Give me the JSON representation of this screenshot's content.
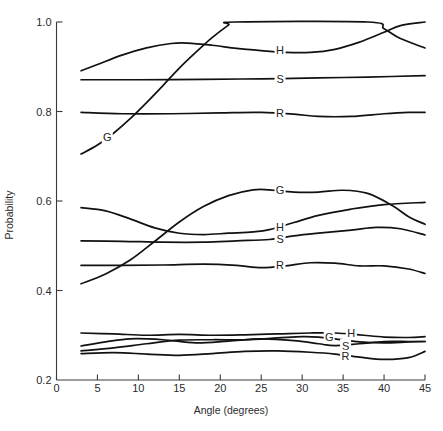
{
  "chart_data": {
    "type": "line",
    "title": "",
    "xlabel": "Angle (degrees)",
    "ylabel": "Probability",
    "xlim": [
      0,
      45
    ],
    "ylim": [
      0.2,
      1.0
    ],
    "xticks": [
      0,
      5,
      10,
      15,
      20,
      25,
      30,
      35,
      40,
      45
    ],
    "xticklabels": [
      "0",
      "5",
      "10",
      "15",
      "20",
      "25",
      "30",
      "35",
      "40",
      "45"
    ],
    "yticks": [
      0.2,
      0.4,
      0.6,
      0.8,
      1.0
    ],
    "yticklabels": [
      "0.2",
      "0.4",
      "0.6",
      "0.8",
      "1.0"
    ],
    "grid": false,
    "legend_position": "inline-labels",
    "groups": [
      {
        "name": "upper-group",
        "series": [
          {
            "name": "G",
            "label": "G",
            "x": [
              3,
              5,
              7,
              9,
              11,
              13,
              15,
              17,
              19,
              21,
              21.8,
              38,
              40,
              42,
              45
            ],
            "values": [
              0.705,
              0.725,
              0.752,
              0.784,
              0.82,
              0.858,
              0.897,
              0.932,
              0.965,
              0.993,
              1.0,
              1.0,
              0.985,
              0.963,
              0.942
            ]
          },
          {
            "name": "H",
            "label": "H",
            "x": [
              3,
              5,
              8,
              11,
              14,
              16,
              19,
              22,
              25,
              28,
              31,
              34,
              37,
              40,
              42,
              45
            ],
            "values": [
              0.891,
              0.905,
              0.926,
              0.942,
              0.952,
              0.953,
              0.948,
              0.941,
              0.936,
              0.932,
              0.932,
              0.939,
              0.955,
              0.977,
              0.992,
              1.0
            ]
          },
          {
            "name": "S",
            "label": "S",
            "x": [
              3,
              10,
              18,
              25,
              32,
              38,
              45
            ],
            "values": [
              0.871,
              0.871,
              0.872,
              0.873,
              0.875,
              0.877,
              0.88
            ]
          },
          {
            "name": "R",
            "label": "R",
            "x": [
              3,
              8,
              14,
              20,
              25,
              29,
              32,
              36,
              40,
              43,
              45
            ],
            "values": [
              0.798,
              0.795,
              0.795,
              0.797,
              0.798,
              0.794,
              0.789,
              0.789,
              0.795,
              0.798,
              0.798
            ]
          }
        ]
      },
      {
        "name": "middle-group",
        "series": [
          {
            "name": "G",
            "label": "G",
            "x": [
              3,
              6,
              9,
              12,
              15,
              18,
              21,
              24,
              26,
              29,
              32,
              35,
              38,
              41,
              43,
              45
            ],
            "values": [
              0.415,
              0.437,
              0.468,
              0.51,
              0.553,
              0.588,
              0.612,
              0.625,
              0.625,
              0.62,
              0.62,
              0.624,
              0.617,
              0.59,
              0.565,
              0.548
            ]
          },
          {
            "name": "H",
            "label": "H",
            "x": [
              3,
              6,
              9,
              12,
              15,
              18,
              21,
              24,
              26,
              29,
              32,
              36,
              40,
              45
            ],
            "values": [
              0.585,
              0.578,
              0.56,
              0.54,
              0.528,
              0.525,
              0.528,
              0.531,
              0.536,
              0.552,
              0.568,
              0.582,
              0.592,
              0.597
            ]
          },
          {
            "name": "S",
            "label": "S",
            "x": [
              3,
              8,
              13,
              18,
              22,
              26,
              29,
              32,
              36,
              39,
              42,
              45
            ],
            "values": [
              0.511,
              0.51,
              0.508,
              0.508,
              0.511,
              0.514,
              0.522,
              0.528,
              0.535,
              0.541,
              0.538,
              0.524
            ]
          },
          {
            "name": "R",
            "label": "R",
            "x": [
              3,
              8,
              13,
              18,
              22,
              25,
              28,
              31,
              34,
              37,
              40,
              43,
              45
            ],
            "values": [
              0.456,
              0.456,
              0.457,
              0.459,
              0.456,
              0.451,
              0.455,
              0.462,
              0.461,
              0.455,
              0.455,
              0.448,
              0.438
            ]
          }
        ]
      },
      {
        "name": "lower-group",
        "series": [
          {
            "name": "H",
            "label": "H",
            "x": [
              3,
              7,
              11,
              15,
              19,
              23,
              27,
              31,
              34,
              37,
              40,
              43,
              45
            ],
            "values": [
              0.305,
              0.303,
              0.3,
              0.302,
              0.3,
              0.301,
              0.303,
              0.305,
              0.305,
              0.301,
              0.296,
              0.295,
              0.297
            ]
          },
          {
            "name": "G",
            "label": "G",
            "x": [
              3,
              7,
              11,
              15,
              19,
              23,
              27,
              30,
              32,
              34,
              37,
              40,
              43,
              45
            ],
            "values": [
              0.265,
              0.272,
              0.281,
              0.289,
              0.29,
              0.29,
              0.294,
              0.297,
              0.296,
              0.292,
              0.285,
              0.283,
              0.285,
              0.286
            ]
          },
          {
            "name": "S",
            "label": "S",
            "x": [
              3,
              6,
              9,
              13,
              17,
              21,
              25,
              29,
              32,
              34,
              37,
              40,
              43,
              45
            ],
            "values": [
              0.276,
              0.285,
              0.292,
              0.29,
              0.283,
              0.287,
              0.292,
              0.288,
              0.281,
              0.277,
              0.281,
              0.286,
              0.286,
              0.286
            ]
          },
          {
            "name": "R",
            "label": "R",
            "x": [
              3,
              7,
              11,
              15,
              19,
              23,
              27,
              31,
              34,
              37,
              40,
              43,
              45
            ],
            "values": [
              0.259,
              0.261,
              0.258,
              0.255,
              0.259,
              0.264,
              0.265,
              0.262,
              0.258,
              0.251,
              0.246,
              0.25,
              0.264
            ]
          }
        ]
      }
    ],
    "annotations": [
      {
        "text": "G",
        "group": "upper-group",
        "x": 6.2,
        "y": 0.742
      },
      {
        "text": "H",
        "group": "upper-group",
        "x": 27.3,
        "y": 0.938
      },
      {
        "text": "S",
        "group": "upper-group",
        "x": 27.3,
        "y": 0.872
      },
      {
        "text": "R",
        "group": "upper-group",
        "x": 27.3,
        "y": 0.797
      },
      {
        "text": "G",
        "group": "middle-group",
        "x": 27.3,
        "y": 0.625
      },
      {
        "text": "H",
        "group": "middle-group",
        "x": 27.3,
        "y": 0.541
      },
      {
        "text": "S",
        "group": "middle-group",
        "x": 27.3,
        "y": 0.515
      },
      {
        "text": "R",
        "group": "middle-group",
        "x": 27.3,
        "y": 0.458
      },
      {
        "text": "H",
        "group": "lower-group",
        "x": 36.0,
        "y": 0.305
      },
      {
        "text": "G",
        "group": "lower-group",
        "x": 33.3,
        "y": 0.295
      },
      {
        "text": "S",
        "group": "lower-group",
        "x": 35.3,
        "y": 0.277
      },
      {
        "text": "R",
        "group": "lower-group",
        "x": 35.3,
        "y": 0.253
      }
    ]
  },
  "colors": {
    "curve": "#111111",
    "axis": "#3a3a3a",
    "text": "#2b2b2b",
    "background": "#ffffff"
  }
}
